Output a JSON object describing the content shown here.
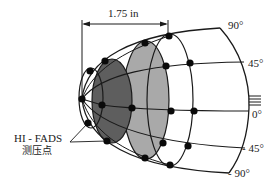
{
  "diagram": {
    "dimension_label": "1.75 in",
    "sensor_label_line1": "HI - FADS",
    "sensor_label_line2": "测压点",
    "angle_labels": {
      "a90": "90°",
      "a45": "45°",
      "a0": "0°",
      "am45": "- 45°",
      "am90": "- 90°"
    },
    "colors": {
      "line": "#1a1a1a",
      "dot": "#0a0a0a",
      "dark_ellipse": "#5e5e5e",
      "light_ellipse": "#a9a9a9",
      "background": "#ffffff"
    },
    "pressure_ports": [
      [
        82,
        99
      ],
      [
        90,
        71
      ],
      [
        105,
        61
      ],
      [
        145,
        43
      ],
      [
        169,
        36
      ],
      [
        166,
        66
      ],
      [
        190,
        63
      ],
      [
        102,
        105
      ],
      [
        132,
        108
      ],
      [
        171,
        111
      ],
      [
        194,
        111
      ],
      [
        88,
        123
      ],
      [
        107,
        141
      ],
      [
        163,
        143
      ],
      [
        188,
        146
      ],
      [
        145,
        158
      ],
      [
        170,
        165
      ]
    ]
  }
}
